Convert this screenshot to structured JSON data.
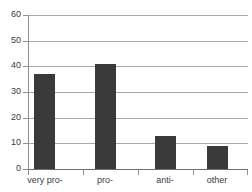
{
  "chart_data": {
    "type": "bar",
    "title": "",
    "subtitle": "",
    "xlabel": "",
    "ylabel": "",
    "categories": [
      "very pro-",
      "pro-",
      "anti-",
      "other"
    ],
    "values": [
      37,
      41,
      13,
      9
    ],
    "series": [
      {
        "name": "",
        "values": [
          37,
          41,
          13,
          9
        ]
      }
    ],
    "ylim": [
      0,
      60
    ],
    "yticks": [
      0,
      10,
      20,
      30,
      40,
      50,
      60
    ],
    "ytick_labels": [
      "0",
      "10",
      "20",
      "30",
      "40",
      "50",
      "60"
    ],
    "grid": true,
    "grid_axis": "y",
    "legend": false,
    "legend_position": "none",
    "bar_color": "#3a3a3a",
    "grid_color": "#a8a8a8",
    "axis_color": "#6e6e6e",
    "background_color": "#ffffff",
    "text_color": "#3b3b3b"
  }
}
